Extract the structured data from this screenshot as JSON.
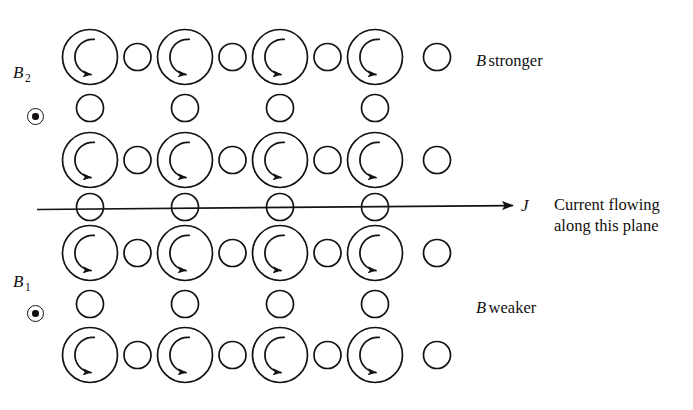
{
  "figure": {
    "type": "physics-diagram",
    "background_color": "#ffffff",
    "stroke_color": "#161212",
    "width": 693,
    "height": 410
  },
  "labels": {
    "b2": "B",
    "b2_sub": "2",
    "b1": "B",
    "b1_sub": "1",
    "b_stronger_italic": "B",
    "b_stronger_rest": "stronger",
    "b_weaker_italic": "B",
    "b_weaker_rest": "weaker",
    "current_line1": "Current flowing",
    "current_line2": "along this plane",
    "j": "J"
  },
  "symbols": {
    "b2_dot": "field-out-of-page-dot",
    "b1_dot": "field-out-of-page-dot"
  },
  "lattice": {
    "rows": 4,
    "cols": 4,
    "large_radius": 27.5,
    "small_radius": 13.5,
    "col_centers": [
      90,
      185,
      280,
      375
    ],
    "row_centers": [
      57,
      160,
      253,
      355
    ],
    "h_connector_x": [
      137.5,
      232.5,
      327.5,
      437
    ],
    "v_connector_y": [
      108,
      207,
      304
    ],
    "vortex_arrow": "counterclockwise-spiral-arrow"
  },
  "current_arrow": {
    "x_start": 37,
    "x_end": 516,
    "y": 207,
    "direction": "right"
  }
}
